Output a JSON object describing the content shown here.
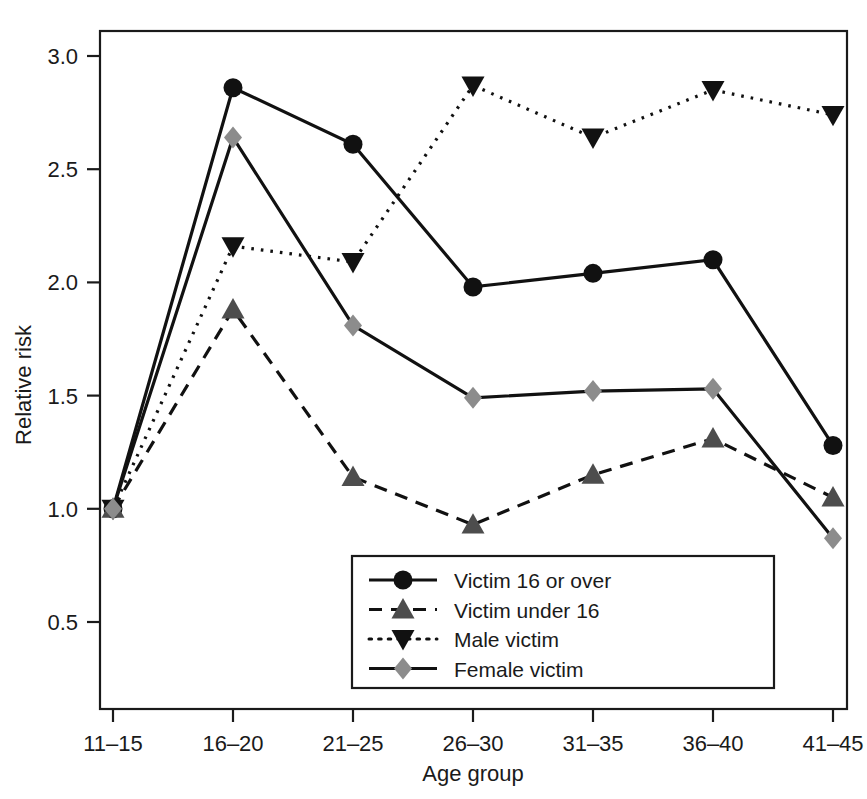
{
  "chart_data": {
    "type": "line",
    "title": "",
    "xlabel": "Age group",
    "ylabel": "Relative risk",
    "categories": [
      "11–15",
      "16–20",
      "21–25",
      "26–30",
      "31–35",
      "36–40",
      "41–45"
    ],
    "x_tick_labels": [
      "11–15",
      "16–20",
      "21–25",
      "26–30",
      "31–35",
      "36–40",
      "41–45"
    ],
    "y_tick_labels": [
      "0.5",
      "1.0",
      "1.5",
      "2.0",
      "2.5",
      "3.0"
    ],
    "y_tick_values": [
      0.5,
      1.0,
      1.5,
      2.0,
      2.5,
      3.0
    ],
    "ylim": [
      0.28,
      3.12
    ],
    "xlim": [
      0.5,
      7.5
    ],
    "grid": false,
    "legend_position": "bottom-center-inside",
    "series": [
      {
        "name": "Victim 16 or over",
        "values": [
          1.0,
          2.86,
          2.61,
          1.98,
          2.04,
          2.1,
          1.28
        ],
        "marker": "circle",
        "marker_color": "#111111",
        "line_style": "solid",
        "line_color": "#111111"
      },
      {
        "name": "Victim under 16",
        "values": [
          1.0,
          1.88,
          1.14,
          0.93,
          1.15,
          1.31,
          1.05
        ],
        "marker": "triangle-up",
        "marker_color": "#4d4d4d",
        "line_style": "dashed",
        "line_color": "#111111"
      },
      {
        "name": "Male victim",
        "values": [
          1.0,
          2.16,
          2.09,
          2.87,
          2.64,
          2.85,
          2.74
        ],
        "marker": "triangle-down",
        "marker_color": "#111111",
        "line_style": "dotted",
        "line_color": "#111111"
      },
      {
        "name": "Female victim",
        "values": [
          1.0,
          2.64,
          1.81,
          1.49,
          1.52,
          1.53,
          0.87
        ],
        "marker": "diamond",
        "marker_color": "#8c8c8c",
        "line_style": "solid",
        "line_color": "#111111"
      }
    ]
  },
  "legend": {
    "items": [
      {
        "label": "Victim 16 or over"
      },
      {
        "label": "Victim under 16"
      },
      {
        "label": "Male victim"
      },
      {
        "label": "Female victim"
      }
    ]
  },
  "axes": {
    "y_title": "Relative risk",
    "x_title": "Age group"
  }
}
